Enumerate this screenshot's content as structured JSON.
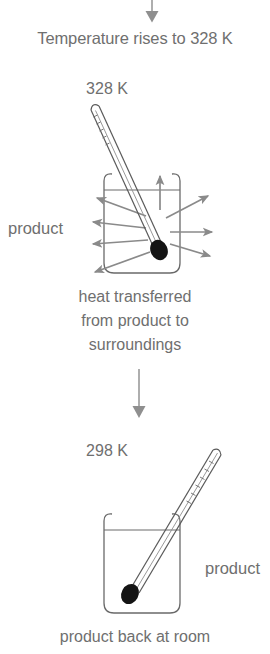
{
  "diagram": {
    "title_caption": "Temperature rises to 328 K",
    "stage_hot": {
      "temperature_label": "328 K",
      "product_label": "product",
      "heat_caption_line1": "heat transferred",
      "heat_caption_line2": "from product to",
      "heat_caption_line3": "surroundings",
      "outward_arrow_count": 9
    },
    "stage_cool": {
      "temperature_label": "298 K",
      "product_label": "product",
      "bottom_caption": "product back at room"
    },
    "colors": {
      "text": "#6f6f6f",
      "arrow_gray": "#808080",
      "outline": "#5a5a5a",
      "bulb": "#1a1a1a",
      "connector": "#9a9a9a",
      "background": "#ffffff"
    }
  }
}
